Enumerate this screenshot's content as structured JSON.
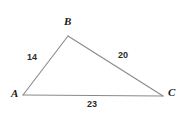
{
  "figure": {
    "type": "triangle-diagram",
    "background_color": "#ffffff",
    "stroke_color": "#8a8a8a",
    "label_color": "#1a1a1a"
  },
  "vertices": [
    {
      "name": "A",
      "label": "A",
      "x": 23,
      "y": 95
    },
    {
      "name": "B",
      "label": "B",
      "x": 68,
      "y": 36
    },
    {
      "name": "C",
      "label": "C",
      "x": 163,
      "y": 96
    }
  ],
  "sides": [
    {
      "name": "AB",
      "label": "14",
      "from": "A",
      "to": "B"
    },
    {
      "name": "BC",
      "label": "20",
      "from": "B",
      "to": "C"
    },
    {
      "name": "AC",
      "label": "23",
      "from": "A",
      "to": "C"
    }
  ]
}
